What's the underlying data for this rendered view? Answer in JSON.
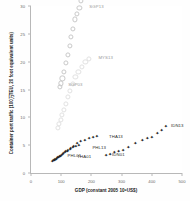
{
  "chart_data": {
    "type": "scatter",
    "title": "",
    "xlabel": "GDP (constant 2005 10⁹US$)",
    "ylabel": "Container port traffic (100万TEU, 20 foot equivalent units)",
    "xlim": [
      0,
      500
    ],
    "ylim": [
      0,
      30
    ],
    "xticks": [
      0,
      100,
      200,
      300,
      400,
      500
    ],
    "yticks": [
      0,
      5,
      10,
      15,
      20,
      25,
      30
    ],
    "grid": false,
    "legend": "none",
    "annotations": [
      {
        "text": "SGP13",
        "x": 180,
        "y": 32.6
      },
      {
        "text": "SGP03",
        "x": 110,
        "y": 16.0
      },
      {
        "text": "MYS13",
        "x": 210,
        "y": 20.8
      },
      {
        "text": "THA13",
        "x": 245,
        "y": 6.6
      },
      {
        "text": "THA01",
        "x": 140,
        "y": 3.1
      },
      {
        "text": "IDN13",
        "x": 450,
        "y": 8.6
      },
      {
        "text": "IDN01",
        "x": 255,
        "y": 3.4
      },
      {
        "text": "PHL01",
        "x": 108,
        "y": 3.3
      },
      {
        "text": "PHL13",
        "x": 190,
        "y": 4.6
      }
    ],
    "series": [
      {
        "name": "SGP",
        "marker": "open-circle",
        "color": "#c9c9c9",
        "points": [
          [
            95,
            15.5
          ],
          [
            100,
            16.1
          ],
          [
            104,
            17.0
          ],
          [
            109,
            18.1
          ],
          [
            116,
            19.8
          ],
          [
            122,
            21.2
          ],
          [
            128,
            22.8
          ],
          [
            133,
            24.4
          ],
          [
            140,
            25.9
          ],
          [
            146,
            27.6
          ],
          [
            152,
            28.6
          ],
          [
            160,
            29.6
          ],
          [
            166,
            30.9
          ],
          [
            172,
            31.6
          ],
          [
            176,
            32.3
          ]
        ]
      },
      {
        "name": "MYS",
        "marker": "open-circle-light",
        "color": "#e2e2e2",
        "points": [
          [
            88,
            8.1
          ],
          [
            93,
            8.8
          ],
          [
            98,
            9.6
          ],
          [
            103,
            10.5
          ],
          [
            109,
            11.4
          ],
          [
            115,
            12.4
          ],
          [
            122,
            13.6
          ],
          [
            130,
            14.8
          ],
          [
            138,
            16.0
          ],
          [
            147,
            17.2
          ],
          [
            157,
            18.2
          ],
          [
            168,
            19.1
          ],
          [
            180,
            19.9
          ],
          [
            192,
            20.5
          ]
        ]
      },
      {
        "name": "THA",
        "marker": "cross",
        "color": "#1c1c1c",
        "points": [
          [
            78,
            2.4
          ],
          [
            83,
            2.6
          ],
          [
            88,
            2.8
          ],
          [
            94,
            3.0
          ],
          [
            100,
            3.3
          ],
          [
            107,
            3.6
          ],
          [
            114,
            3.9
          ],
          [
            122,
            4.2
          ],
          [
            131,
            4.5
          ],
          [
            141,
            4.9
          ],
          [
            152,
            5.3
          ],
          [
            164,
            5.7
          ],
          [
            178,
            6.0
          ],
          [
            192,
            6.3
          ],
          [
            205,
            6.5
          ],
          [
            218,
            6.6
          ]
        ]
      },
      {
        "name": "IDN",
        "marker": "cross",
        "color": "#1c1c1c",
        "points": [
          [
            248,
            3.2
          ],
          [
            262,
            3.5
          ],
          [
            276,
            3.8
          ],
          [
            290,
            4.0
          ],
          [
            305,
            4.2
          ],
          [
            322,
            4.6
          ],
          [
            345,
            5.3
          ],
          [
            368,
            6.0
          ],
          [
            385,
            6.3
          ],
          [
            400,
            6.4
          ],
          [
            418,
            7.1
          ],
          [
            432,
            7.8
          ],
          [
            446,
            8.4
          ]
        ]
      },
      {
        "name": "PHL",
        "marker": "cross",
        "color": "#1c1c1c",
        "points": [
          [
            70,
            2.2
          ],
          [
            74,
            2.3
          ],
          [
            79,
            2.5
          ],
          [
            85,
            2.7
          ],
          [
            91,
            2.9
          ],
          [
            97,
            3.1
          ],
          [
            104,
            3.4
          ],
          [
            112,
            3.7
          ],
          [
            120,
            4.0
          ],
          [
            129,
            4.3
          ],
          [
            138,
            4.6
          ],
          [
            148,
            4.9
          ],
          [
            158,
            5.1
          ]
        ]
      }
    ]
  }
}
